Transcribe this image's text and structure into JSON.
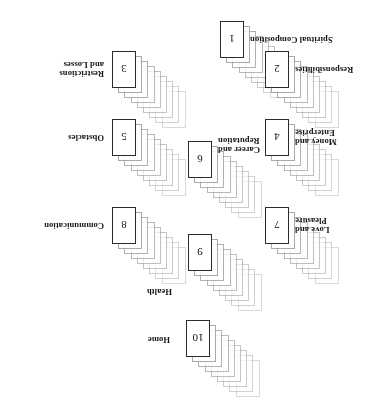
{
  "figure": {
    "rotation_degrees": 180,
    "background_color": "#ffffff",
    "front_card_border_color": "#2b2b2b",
    "back_card_border_color": "#9b9b9b"
  },
  "stacks": [
    {
      "number": "1",
      "label": "Spiritual Composition",
      "cards_in_stack": 9,
      "front_card_x": 148,
      "front_card_y": 357,
      "label_x": 142,
      "label_y": 376,
      "label_side": "left"
    },
    {
      "number": "2",
      "label": "Responsibilities",
      "cards_in_stack": 9,
      "front_card_x": 103,
      "front_card_y": 327,
      "label_x": 97,
      "label_y": 346,
      "label_side": "left"
    },
    {
      "number": "3",
      "label": "Restrictions\nand Losses",
      "cards_in_stack": 9,
      "front_card_x": 256,
      "front_card_y": 327,
      "label_x": 288,
      "label_y": 346,
      "label_side": "right"
    },
    {
      "number": "4",
      "label": "Money and\nEnterprise",
      "cards_in_stack": 9,
      "front_card_x": 103,
      "front_card_y": 259,
      "label_x": 97,
      "label_y": 278,
      "label_side": "left"
    },
    {
      "number": "5",
      "label": "Obstacles",
      "cards_in_stack": 9,
      "front_card_x": 256,
      "front_card_y": 259,
      "label_x": 288,
      "label_y": 278,
      "label_side": "right"
    },
    {
      "number": "6",
      "label": "Career and\nReputation",
      "cards_in_stack": 9,
      "front_card_x": 180,
      "front_card_y": 237,
      "label_x": 174,
      "label_y": 270,
      "label_side": "left"
    },
    {
      "number": "7",
      "label": "Love and\nPleasure",
      "cards_in_stack": 9,
      "front_card_x": 103,
      "front_card_y": 171,
      "label_x": 97,
      "label_y": 190,
      "label_side": "left"
    },
    {
      "number": "8",
      "label": "Communication",
      "cards_in_stack": 9,
      "front_card_x": 256,
      "front_card_y": 171,
      "label_x": 288,
      "label_y": 190,
      "label_side": "right"
    },
    {
      "number": "9",
      "label": "Health",
      "cards_in_stack": 9,
      "front_card_x": 180,
      "front_card_y": 144,
      "label_x": 220,
      "label_y": 124,
      "label_side": "right"
    },
    {
      "number": "10",
      "label": "Home",
      "cards_in_stack": 9,
      "front_card_x": 182,
      "front_card_y": 58,
      "label_x": 222,
      "label_y": 76,
      "label_side": "right"
    }
  ]
}
